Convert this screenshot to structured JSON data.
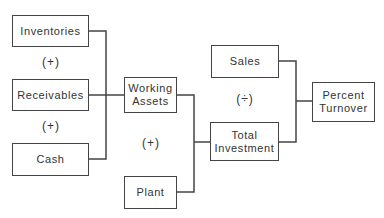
{
  "diagram": {
    "nodes": [
      {
        "id": "inventories",
        "label": "Inventories"
      },
      {
        "id": "receivables",
        "label": "Receivables"
      },
      {
        "id": "cash",
        "label": "Cash"
      },
      {
        "id": "working_assets",
        "label": "Working\nAssets"
      },
      {
        "id": "plant",
        "label": "Plant"
      },
      {
        "id": "total_investment",
        "label": "Total\nInvestment"
      },
      {
        "id": "sales",
        "label": "Sales"
      },
      {
        "id": "percent_turnover",
        "label": "Percent\nTurnover"
      }
    ],
    "operators": [
      {
        "id": "op1",
        "label": "(+)"
      },
      {
        "id": "op2",
        "label": "(+)"
      },
      {
        "id": "op3",
        "label": "(+)"
      },
      {
        "id": "op4",
        "label": "(÷)"
      }
    ],
    "edges": [
      {
        "from": [
          "inventories",
          "receivables",
          "cash"
        ],
        "to": "working_assets",
        "operator": "+"
      },
      {
        "from": [
          "working_assets",
          "plant"
        ],
        "to": "total_investment",
        "operator": "+"
      },
      {
        "from": [
          "sales",
          "total_investment"
        ],
        "to": "percent_turnover",
        "operator": "÷"
      }
    ],
    "colors": {
      "line": "#444444",
      "text": "#333333",
      "background": "#ffffff"
    }
  }
}
